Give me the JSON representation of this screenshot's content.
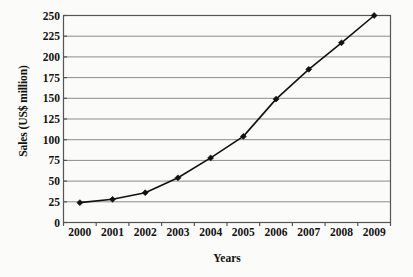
{
  "chart_data": {
    "type": "line",
    "title": "",
    "xlabel": "Years",
    "ylabel": "Sales (US$ million)",
    "categories": [
      "2000",
      "2001",
      "2002",
      "2003",
      "2004",
      "2005",
      "2006",
      "2007",
      "2008",
      "2009"
    ],
    "values": [
      24,
      28,
      36,
      54,
      78,
      104,
      149,
      185,
      217,
      250
    ],
    "series": [
      {
        "name": "Sales",
        "values": [
          24,
          28,
          36,
          54,
          78,
          104,
          149,
          185,
          217,
          250
        ]
      }
    ],
    "ylim": [
      0,
      250
    ],
    "yticks": [
      0,
      25,
      50,
      75,
      100,
      125,
      150,
      175,
      200,
      225,
      250
    ],
    "ytick_labels": [
      "0",
      "25",
      "50",
      "75",
      "100",
      "125",
      "150",
      "175",
      "200",
      "225",
      "250"
    ],
    "xtick_labels": [
      "2000",
      "2001",
      "2002",
      "2003",
      "2004",
      "2005",
      "2006",
      "2007",
      "2008",
      "2009"
    ],
    "grid": "horizontal",
    "legend": "none",
    "marker": "diamond",
    "colors": {
      "line": "#111111",
      "marker": "#111111",
      "grid": "#8c8c8c",
      "frame": "#555555",
      "background": "#fbfbf9",
      "text": "#121212"
    }
  }
}
